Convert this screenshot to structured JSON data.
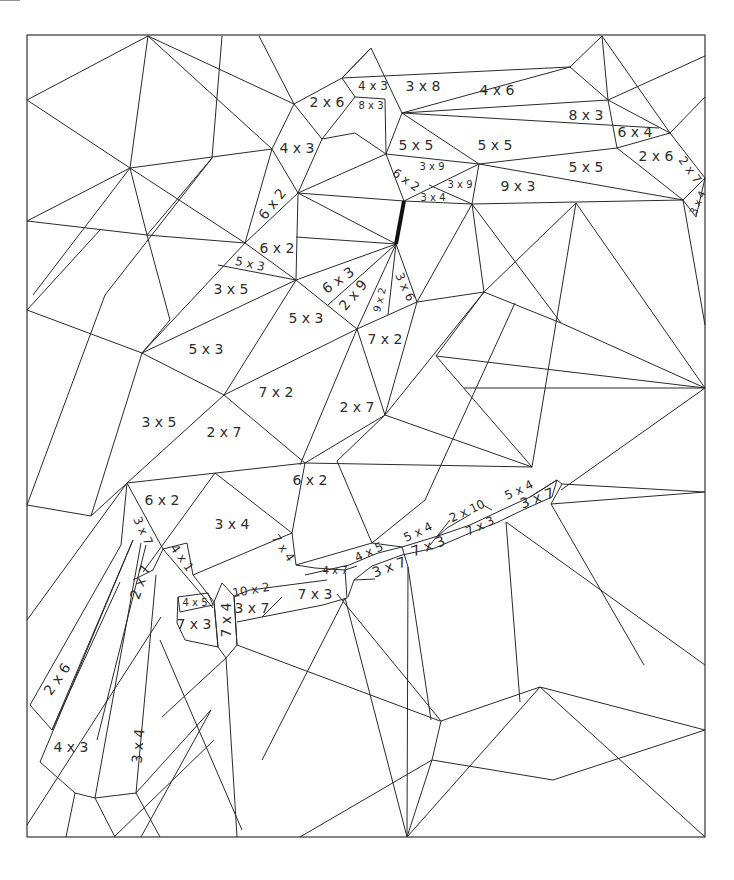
{
  "frame": {
    "x": 27,
    "y": 35,
    "width": 678,
    "height": 802,
    "stroke": "#333333"
  },
  "labels": [
    {
      "text": "2 x 6",
      "x": 327,
      "y": 102,
      "size": "l",
      "rot": 0
    },
    {
      "text": "4 x 3",
      "x": 373,
      "y": 86,
      "size": "m",
      "rot": 0
    },
    {
      "text": "8 x 3",
      "x": 371,
      "y": 106,
      "size": "s",
      "rot": 0
    },
    {
      "text": "3 x 8",
      "x": 423,
      "y": 86,
      "size": "l",
      "rot": 0
    },
    {
      "text": "4 x 6",
      "x": 497,
      "y": 90,
      "size": "l",
      "rot": 0
    },
    {
      "text": "8 x 3",
      "x": 586,
      "y": 115,
      "size": "l",
      "rot": 0
    },
    {
      "text": "6 x 4",
      "x": 635,
      "y": 132,
      "size": "l",
      "rot": 0
    },
    {
      "text": "2 x 6",
      "x": 656,
      "y": 156,
      "size": "l",
      "rot": 0
    },
    {
      "text": "2 x 7",
      "x": 690,
      "y": 170,
      "size": "m",
      "rot": 55
    },
    {
      "text": "3 x 4",
      "x": 698,
      "y": 203,
      "size": "s",
      "rot": -65
    },
    {
      "text": "4 x 3",
      "x": 297,
      "y": 148,
      "size": "l",
      "rot": 0
    },
    {
      "text": "5 x 5",
      "x": 416,
      "y": 145,
      "size": "l",
      "rot": 0
    },
    {
      "text": "5 x 5",
      "x": 495,
      "y": 145,
      "size": "l",
      "rot": 0
    },
    {
      "text": "5 x 5",
      "x": 586,
      "y": 167,
      "size": "l",
      "rot": 0
    },
    {
      "text": "3 x 9",
      "x": 432,
      "y": 167,
      "size": "s",
      "rot": 0
    },
    {
      "text": "3 x 9",
      "x": 460,
      "y": 185,
      "size": "s",
      "rot": 0
    },
    {
      "text": "6 x 2",
      "x": 406,
      "y": 180,
      "size": "m",
      "rot": 35
    },
    {
      "text": "3 x 4",
      "x": 433,
      "y": 198,
      "size": "s",
      "rot": 0
    },
    {
      "text": "9 x 3",
      "x": 518,
      "y": 186,
      "size": "l",
      "rot": 0
    },
    {
      "text": "6 x 2",
      "x": 272,
      "y": 204,
      "size": "l",
      "rot": -52
    },
    {
      "text": "6 x 2",
      "x": 277,
      "y": 248,
      "size": "l",
      "rot": 0
    },
    {
      "text": "5 x 3",
      "x": 250,
      "y": 264,
      "size": "m",
      "rot": 12
    },
    {
      "text": "3 x 5",
      "x": 231,
      "y": 289,
      "size": "l",
      "rot": 0
    },
    {
      "text": "6 x 3",
      "x": 338,
      "y": 280,
      "size": "l",
      "rot": -35
    },
    {
      "text": "2 x 9",
      "x": 353,
      "y": 295,
      "size": "l",
      "rot": -50
    },
    {
      "text": "9 x 2",
      "x": 380,
      "y": 300,
      "size": "s",
      "rot": -75
    },
    {
      "text": "3 x 6",
      "x": 405,
      "y": 287,
      "size": "m",
      "rot": 65
    },
    {
      "text": "5 x 3",
      "x": 306,
      "y": 318,
      "size": "l",
      "rot": 0
    },
    {
      "text": "7 x 2",
      "x": 385,
      "y": 339,
      "size": "l",
      "rot": 0
    },
    {
      "text": "5 x 3",
      "x": 206,
      "y": 349,
      "size": "l",
      "rot": 0
    },
    {
      "text": "7 x 2",
      "x": 276,
      "y": 392,
      "size": "l",
      "rot": 0
    },
    {
      "text": "2 x 7",
      "x": 357,
      "y": 407,
      "size": "l",
      "rot": 0
    },
    {
      "text": "3 x 5",
      "x": 159,
      "y": 422,
      "size": "l",
      "rot": 0
    },
    {
      "text": "2 x 7",
      "x": 224,
      "y": 432,
      "size": "l",
      "rot": 0
    },
    {
      "text": "6 x 2",
      "x": 310,
      "y": 480,
      "size": "l",
      "rot": 0
    },
    {
      "text": "6 x 2",
      "x": 162,
      "y": 500,
      "size": "l",
      "rot": 0
    },
    {
      "text": "3 x 4",
      "x": 232,
      "y": 524,
      "size": "l",
      "rot": 0
    },
    {
      "text": "3 x 7",
      "x": 143,
      "y": 531,
      "size": "m",
      "rot": 65
    },
    {
      "text": "7 x 4",
      "x": 283,
      "y": 548,
      "size": "m",
      "rot": 55
    },
    {
      "text": "4 x 1",
      "x": 182,
      "y": 558,
      "size": "m",
      "rot": 55
    },
    {
      "text": "2 x 7",
      "x": 140,
      "y": 582,
      "size": "l",
      "rot": -70
    },
    {
      "text": "4 x 7",
      "x": 335,
      "y": 571,
      "size": "s",
      "rot": 0
    },
    {
      "text": "10 x 2",
      "x": 251,
      "y": 590,
      "size": "m",
      "rot": -10
    },
    {
      "text": "3 x 7",
      "x": 252,
      "y": 608,
      "size": "l",
      "rot": 0
    },
    {
      "text": "7 x 3",
      "x": 315,
      "y": 594,
      "size": "l",
      "rot": 0
    },
    {
      "text": "4 x 5",
      "x": 195,
      "y": 603,
      "size": "s",
      "rot": 0
    },
    {
      "text": "7 x 3",
      "x": 194,
      "y": 624,
      "size": "l",
      "rot": 0
    },
    {
      "text": "7 x 4",
      "x": 226,
      "y": 620,
      "size": "l",
      "rot": -90
    },
    {
      "text": "4 x 5",
      "x": 369,
      "y": 552,
      "size": "m",
      "rot": -25
    },
    {
      "text": "3 x 7",
      "x": 389,
      "y": 567,
      "size": "l",
      "rot": -20
    },
    {
      "text": "5 x 4",
      "x": 418,
      "y": 532,
      "size": "m",
      "rot": -25
    },
    {
      "text": "7 x 3",
      "x": 428,
      "y": 546,
      "size": "l",
      "rot": -20
    },
    {
      "text": "2 x 10",
      "x": 467,
      "y": 511,
      "size": "m",
      "rot": -25
    },
    {
      "text": "7 x 3",
      "x": 480,
      "y": 526,
      "size": "m",
      "rot": -25
    },
    {
      "text": "5 x 4",
      "x": 519,
      "y": 490,
      "size": "m",
      "rot": -25
    },
    {
      "text": "3 x 7",
      "x": 537,
      "y": 498,
      "size": "l",
      "rot": -20
    },
    {
      "text": "2 x 6",
      "x": 57,
      "y": 679,
      "size": "l",
      "rot": -55
    },
    {
      "text": "4 x 3",
      "x": 71,
      "y": 747,
      "size": "l",
      "rot": 0
    },
    {
      "text": "3 x 4",
      "x": 138,
      "y": 746,
      "size": "l",
      "rot": -85
    }
  ],
  "thick_segments": [
    {
      "x1": 404,
      "y1": 201,
      "x2": 396,
      "y2": 244
    }
  ]
}
